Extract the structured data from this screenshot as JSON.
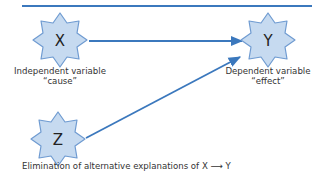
{
  "diagram": {
    "colors": {
      "line": "#3b78bd",
      "star_fill": "#c6daf0",
      "star_stroke": "#6f9bd1",
      "text": "#333333"
    },
    "nodes": [
      {
        "id": "X",
        "letter": "X",
        "label": "Independent variable",
        "sublabel": "“cause”"
      },
      {
        "id": "Y",
        "letter": "Y",
        "label": "Dependent variable",
        "sublabel": "“effect”"
      },
      {
        "id": "Z",
        "letter": "Z"
      }
    ],
    "edges": [
      {
        "from": "X",
        "to": "Y"
      },
      {
        "from": "Z",
        "to": "Y"
      }
    ],
    "caption": "Elimination of alternative explanations of X ⟶ Y"
  }
}
